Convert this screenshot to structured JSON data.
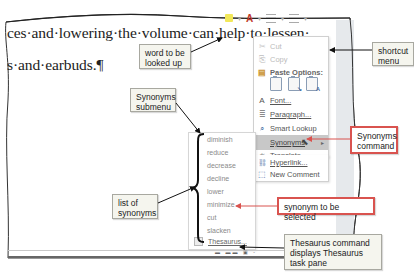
{
  "document": {
    "line1": "ces·and·lowering·the·volume·can·help·to·lessen·",
    "line2": "s·and·earbuds.¶"
  },
  "mini_toolbar": {
    "items": [
      "highlight-color",
      "font-color",
      "bullets",
      "numbering"
    ],
    "font_color_glyph": "A",
    "dropdown_glyph": "▾"
  },
  "shortcut_menu": {
    "items": [
      {
        "label": "Cut",
        "icon": "scissors-icon",
        "glyph": "✂",
        "state": "disabled"
      },
      {
        "label": "Copy",
        "icon": "copy-icon",
        "glyph": "⎘",
        "state": "disabled"
      },
      {
        "label": "Paste Options:",
        "icon": "paste-icon",
        "glyph": "📋",
        "state": "header"
      },
      {
        "label": "Font...",
        "icon": "font-icon",
        "glyph": "A",
        "state": "normal"
      },
      {
        "label": "Paragraph...",
        "icon": "paragraph-icon",
        "glyph": "≣",
        "state": "normal"
      },
      {
        "label": "Smart Lookup",
        "icon": "search-icon",
        "glyph": "⌕",
        "state": "normal"
      },
      {
        "label": "Synonyms",
        "icon": "",
        "glyph": "",
        "state": "hover",
        "submenu_arrow": "▸"
      },
      {
        "label": "Translate",
        "icon": "translate-icon",
        "glyph": "あ",
        "state": "normal"
      },
      {
        "label": "Hyperlink...",
        "icon": "hyperlink-icon",
        "glyph": "🔗",
        "state": "normal"
      },
      {
        "label": "New Comment",
        "icon": "comment-icon",
        "glyph": "⬚",
        "state": "normal"
      }
    ],
    "paste_options": [
      "keep-source-formatting",
      "merge-formatting",
      "keep-text-only"
    ],
    "paste_sub_glyphs": [
      "",
      "↘",
      "A"
    ]
  },
  "synonyms_submenu": {
    "items": [
      "diminish",
      "reduce",
      "decrease",
      "decline",
      "lower",
      "minimize",
      "cut",
      "slacken"
    ],
    "thesaurus_label": "Thesaurus..."
  },
  "callouts": {
    "word_lookup": "word to be looked up",
    "shortcut_menu": "shortcut menu",
    "synonyms_submenu": "Synonyms submenu",
    "synonyms_command": "Synonyms command",
    "list_of_synonyms": "list of synonyms",
    "synonym_selected": "synonym to be selected",
    "thesaurus_command": "Thesaurus command displays Thesaurus task pane"
  },
  "colors": {
    "callout_red": "#d9534f",
    "callout_bg": "#f5f5ee",
    "menu_hover": "#c8c8c8",
    "arrow_black": "#111111"
  }
}
